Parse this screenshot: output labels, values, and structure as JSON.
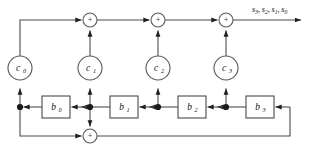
{
  "diagram": {
    "canvas": {
      "width": 315,
      "height": 153,
      "background": "#ffffff"
    },
    "colors": {
      "wire": "#4b4b4b",
      "node_stroke": "#5a5a5a",
      "box_stroke": "#4a4a4a",
      "dot": "#1a1a1a",
      "text": "#111111"
    },
    "coefficient_nodes": [
      {
        "id": "c0",
        "base": "c",
        "sub": "0",
        "cx": 20,
        "cy": 68,
        "r": 12
      },
      {
        "id": "c1",
        "base": "c",
        "sub": "1",
        "cx": 90,
        "cy": 68,
        "r": 12
      },
      {
        "id": "c2",
        "base": "c",
        "sub": "2",
        "cx": 158,
        "cy": 68,
        "r": 12
      },
      {
        "id": "c3",
        "base": "c",
        "sub": "3",
        "cx": 226,
        "cy": 68,
        "r": 12
      }
    ],
    "gain_boxes": [
      {
        "id": "b0",
        "base": "b",
        "sub": "0",
        "x": 42,
        "y": 96,
        "w": 28,
        "h": 22
      },
      {
        "id": "b1",
        "base": "b",
        "sub": "1",
        "x": 110,
        "y": 96,
        "w": 28,
        "h": 22
      },
      {
        "id": "b2",
        "base": "b",
        "sub": "2",
        "x": 178,
        "y": 96,
        "w": 28,
        "h": 22
      },
      {
        "id": "b3",
        "base": "b",
        "sub": "3",
        "x": 246,
        "y": 96,
        "w": 28,
        "h": 22
      }
    ],
    "adders": [
      {
        "id": "adder-top-1",
        "symbol": "+",
        "cx": 90,
        "cy": 20,
        "r": 7
      },
      {
        "id": "adder-top-2",
        "symbol": "+",
        "cx": 158,
        "cy": 20,
        "r": 7
      },
      {
        "id": "adder-top-3",
        "symbol": "+",
        "cx": 226,
        "cy": 20,
        "r": 7
      },
      {
        "id": "adder-bottom",
        "symbol": "+",
        "cx": 90,
        "cy": 136,
        "r": 7
      }
    ],
    "junction_dots": [
      {
        "id": "dot-c0-column",
        "cx": 20,
        "cy": 107,
        "r": 3.1
      },
      {
        "id": "dot-c1-column",
        "cx": 90,
        "cy": 107,
        "r": 3.1
      },
      {
        "id": "dot-c2-column",
        "cx": 158,
        "cy": 107,
        "r": 3.1
      },
      {
        "id": "dot-c3-column",
        "cx": 226,
        "cy": 107,
        "r": 3.1
      }
    ],
    "output": {
      "label_plain": "s3, s2, s1, s0",
      "terms": [
        {
          "base": "s",
          "sub": "3",
          "sep": ","
        },
        {
          "base": "s",
          "sub": "2",
          "sep": ","
        },
        {
          "base": "s",
          "sub": "1",
          "sep": ","
        },
        {
          "base": "s",
          "sub": "0",
          "sep": ""
        }
      ],
      "x": 252,
      "y": 12,
      "arrow_end_x": 302,
      "arrow_y": 20
    },
    "feedback": {
      "right_x": 290,
      "bottom_y": 136,
      "left_x": 20,
      "top_y": 20
    }
  }
}
